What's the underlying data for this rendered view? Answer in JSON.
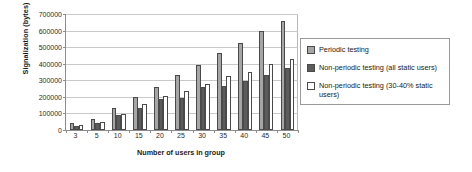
{
  "chart_data": {
    "type": "bar",
    "title": "",
    "xlabel": "Number of users in group",
    "ylabel": "Signalization (bytes)",
    "categories": [
      "3",
      "5",
      "10",
      "15",
      "20",
      "25",
      "30",
      "35",
      "40",
      "45",
      "50"
    ],
    "ylim": [
      0,
      700000
    ],
    "ytick_labels": [
      "700000",
      "600000",
      "500000",
      "400000",
      "300000",
      "200000",
      "100000",
      "0"
    ],
    "ytick_values": [
      700000,
      600000,
      500000,
      400000,
      300000,
      200000,
      100000,
      0
    ],
    "grid": true,
    "legend_position": "right",
    "series": [
      {
        "name": "Periodic testing",
        "color": "#a6a6a6",
        "values": [
          40000,
          67000,
          132000,
          200000,
          262000,
          330000,
          395000,
          462000,
          527000,
          595000,
          660000
        ]
      },
      {
        "name": "Non-periodic testing (all static users)",
        "color": "#5c5c5c",
        "values": [
          27000,
          40000,
          89000,
          135000,
          190000,
          192000,
          259000,
          263000,
          295000,
          330000,
          375000
        ]
      },
      {
        "name": "Non-periodic testing (30-40% static users)",
        "color": "#ffffff",
        "values": [
          33000,
          48000,
          94000,
          155000,
          206000,
          235000,
          277000,
          323000,
          352000,
          400000,
          428000
        ]
      }
    ]
  }
}
